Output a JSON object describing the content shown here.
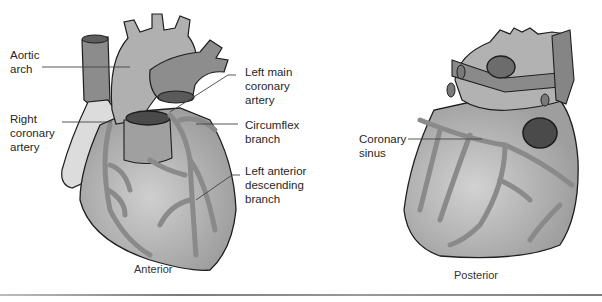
{
  "figure": {
    "anterior": {
      "view_label": "Anterior",
      "labels": {
        "aortic_arch": "Aortic\narch",
        "right_coronary_artery": "Right\ncoronary\nartery",
        "left_main_coronary_artery": "Left main\ncoronary\nartery",
        "circumflex_branch": "Circumflex\nbranch",
        "left_anterior_descending_branch": "Left anterior\ndescending\nbranch"
      }
    },
    "posterior": {
      "view_label": "Posterior",
      "labels": {
        "coronary_sinus": "Coronary\nsinus"
      }
    },
    "colors": {
      "background": "#ffffff",
      "heart_tissue": "#a9a9a9",
      "heart_highlight": "#c8c8c8",
      "vessel": "#8a8a8a",
      "great_vessel": "#7a7a7a",
      "lumen": "#4a4a4a",
      "outline": "#1e1e1e",
      "right_atrium_pale": "#dcdcdc",
      "leader_line": "#444444"
    }
  }
}
